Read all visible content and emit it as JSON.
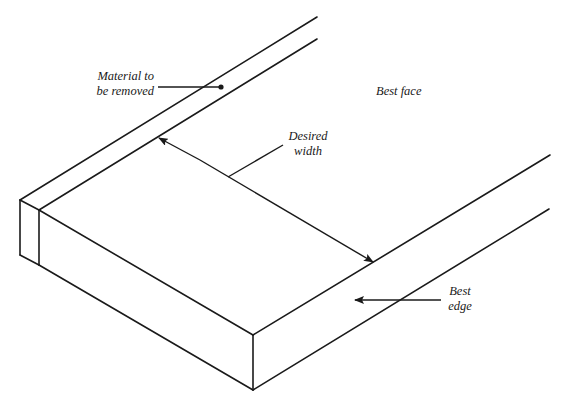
{
  "diagram": {
    "stroke_color": "#1a1a1a",
    "background": "#ffffff",
    "labels": {
      "material": {
        "line1": "Material to",
        "line2": "be removed"
      },
      "best_face": "Best face",
      "desired_width": {
        "line1": "Desired",
        "line2": "width"
      },
      "best_edge": {
        "line1": "Best",
        "line2": "edge"
      }
    },
    "icons": {
      "width_arrow": "double-headed-arrow",
      "edge_arrow": "left-arrow",
      "material_pointer": "dot-leader"
    }
  }
}
